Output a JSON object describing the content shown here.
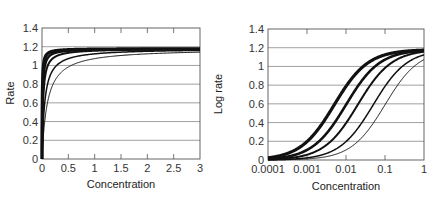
{
  "chart_data": [
    {
      "type": "line",
      "title": "",
      "xlabel": "Concentration",
      "ylabel": "Rate",
      "xscale": "linear",
      "xlim": [
        0,
        3
      ],
      "ylim": [
        0,
        1.4
      ],
      "xticks": [
        "0",
        "0.5",
        "1",
        "1.5",
        "2",
        "2.5",
        "3"
      ],
      "yticks": [
        "0",
        "0.2",
        "0.4",
        "0.6",
        "0.8",
        "1",
        "1.2",
        "1.4"
      ],
      "grid": "horizontal",
      "legend": "none",
      "vmax": 1.18,
      "series": [
        {
          "name": "Km=0.005",
          "km": 0.005,
          "x": [
            0,
            0.05,
            0.1,
            0.25,
            0.5,
            1,
            2,
            3
          ],
          "values": [
            0,
            1.07,
            1.12,
            1.16,
            1.17,
            1.17,
            1.18,
            1.18
          ]
        },
        {
          "name": "Km=0.01",
          "km": 0.01,
          "x": [
            0,
            0.05,
            0.1,
            0.25,
            0.5,
            1,
            2,
            3
          ],
          "values": [
            0,
            0.98,
            1.07,
            1.13,
            1.16,
            1.17,
            1.17,
            1.18
          ]
        },
        {
          "name": "Km=0.02",
          "km": 0.02,
          "x": [
            0,
            0.05,
            0.1,
            0.25,
            0.5,
            1,
            2,
            3
          ],
          "values": [
            0,
            0.84,
            0.98,
            1.09,
            1.13,
            1.16,
            1.17,
            1.17
          ]
        },
        {
          "name": "Km=0.05",
          "km": 0.05,
          "x": [
            0,
            0.05,
            0.1,
            0.25,
            0.5,
            1,
            2,
            3
          ],
          "values": [
            0,
            0.59,
            0.79,
            0.98,
            1.07,
            1.12,
            1.15,
            1.16
          ]
        },
        {
          "name": "Km=0.1",
          "km": 0.1,
          "x": [
            0,
            0.05,
            0.1,
            0.25,
            0.5,
            1,
            2,
            3
          ],
          "values": [
            0,
            0.39,
            0.59,
            0.84,
            0.98,
            1.07,
            1.12,
            1.14
          ]
        }
      ]
    },
    {
      "type": "line",
      "title": "",
      "xlabel": "Concentration",
      "ylabel": "Log rate",
      "xscale": "log",
      "xlim": [
        0.0001,
        1
      ],
      "ylim": [
        0,
        1.4
      ],
      "xticks": [
        "0.0001",
        "0.001",
        "0.01",
        "0.1",
        "1"
      ],
      "yticks": [
        "0",
        "0.2",
        "0.4",
        "0.6",
        "0.8",
        "1",
        "1.2",
        "1.4"
      ],
      "grid": "horizontal",
      "legend": "none",
      "vmax": 1.18,
      "series": [
        {
          "name": "Km=0.005",
          "km": 0.005,
          "x": [
            0.0001,
            0.001,
            0.005,
            0.01,
            0.1,
            1
          ],
          "values": [
            0.02,
            0.2,
            0.59,
            0.79,
            1.12,
            1.17
          ]
        },
        {
          "name": "Km=0.01",
          "km": 0.01,
          "x": [
            0.0001,
            0.001,
            0.01,
            0.1,
            1
          ],
          "values": [
            0.01,
            0.11,
            0.59,
            1.07,
            1.17
          ]
        },
        {
          "name": "Km=0.02",
          "km": 0.02,
          "x": [
            0.0001,
            0.001,
            0.01,
            0.02,
            0.1,
            1
          ],
          "values": [
            0.01,
            0.06,
            0.39,
            0.59,
            0.98,
            1.16
          ]
        },
        {
          "name": "Km=0.05",
          "km": 0.05,
          "x": [
            0.0001,
            0.001,
            0.01,
            0.05,
            0.1,
            1
          ],
          "values": [
            0.0,
            0.02,
            0.2,
            0.59,
            0.79,
            1.12
          ]
        },
        {
          "name": "Km=0.1",
          "km": 0.1,
          "x": [
            0.0001,
            0.001,
            0.01,
            0.1,
            1
          ],
          "values": [
            0.0,
            0.01,
            0.11,
            0.59,
            1.07
          ]
        }
      ]
    }
  ],
  "left_chart": {
    "ylabel": "Rate",
    "xlabel": "Concentration",
    "xticks": [
      "0",
      "0.5",
      "1",
      "1.5",
      "2",
      "2.5",
      "3"
    ],
    "yticks": [
      "0",
      "0.2",
      "0.4",
      "0.6",
      "0.8",
      "1",
      "1.2",
      "1.4"
    ]
  },
  "right_chart": {
    "ylabel": "Log rate",
    "xlabel": "Concentration",
    "xticks": [
      "0.0001",
      "0.001",
      "0.01",
      "0.1",
      "1"
    ],
    "yticks": [
      "0",
      "0.2",
      "0.4",
      "0.6",
      "0.8",
      "1",
      "1.2",
      "1.4"
    ]
  },
  "style": {
    "line_color": "#111111",
    "grid_color": "#888888",
    "frame_color": "#555555",
    "line_widths": [
      3.2,
      2.6,
      2.0,
      1.5,
      1.0
    ]
  }
}
